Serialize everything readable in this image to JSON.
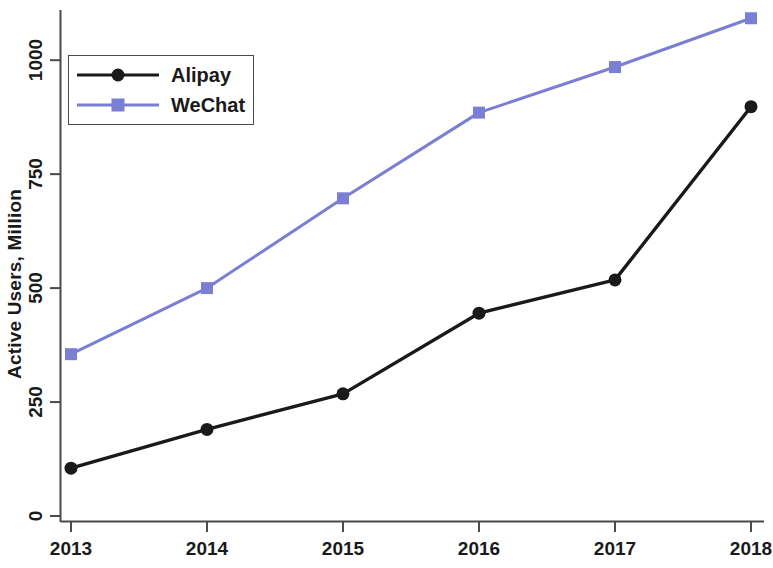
{
  "chart_data": {
    "type": "line",
    "title": "",
    "xlabel": "",
    "ylabel": "Active Users, Million",
    "categories": [
      "2013",
      "2014",
      "2015",
      "2016",
      "2017",
      "2018"
    ],
    "x": [
      2013,
      2014,
      2015,
      2016,
      2017,
      2018
    ],
    "xlim": [
      2013,
      2018
    ],
    "ylim": [
      0,
      1100
    ],
    "yticks": [
      0,
      250,
      500,
      750,
      1000
    ],
    "ytick_labels": [
      "0",
      "250",
      "500",
      "750",
      "1000"
    ],
    "xticks": [
      2013,
      2014,
      2015,
      2016,
      2017,
      2018
    ],
    "xtick_labels": [
      "2013",
      "2014",
      "2015",
      "2016",
      "2017",
      "2018"
    ],
    "grid": false,
    "legend_position": "top-left",
    "series": [
      {
        "name": "Alipay",
        "marker": "circle",
        "color": "#1a1a1a",
        "values": [
          105,
          190,
          268,
          445,
          518,
          898
        ]
      },
      {
        "name": "WeChat",
        "marker": "square",
        "color": "#7B7FD4",
        "values": [
          355,
          500,
          697,
          885,
          985,
          1092
        ]
      }
    ]
  },
  "legend": {
    "items": [
      {
        "label": "Alipay",
        "marker": "circle-marker",
        "color": "#1a1a1a"
      },
      {
        "label": "WeChat",
        "marker": "square-marker",
        "color": "#7B7FD4"
      }
    ]
  },
  "colors": {
    "alipay": "#1a1a1a",
    "wechat": "#7B7FD4",
    "axis": "#4a4a4a",
    "text": "#1a1a1a",
    "background": "#ffffff"
  }
}
